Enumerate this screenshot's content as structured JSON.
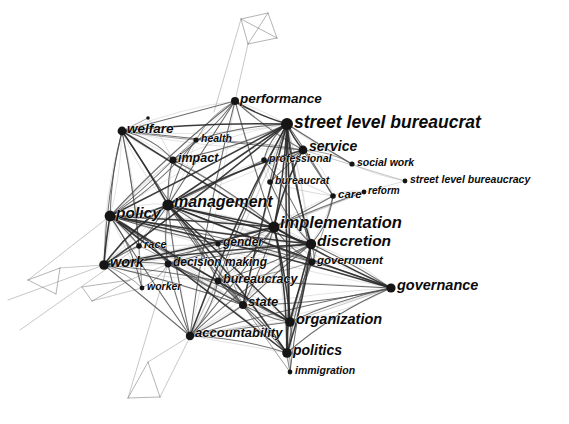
{
  "figure": {
    "type": "network-graph",
    "background_color": "#ffffff",
    "node_color": "#151515",
    "edge_color": "#2a2a2a",
    "label_color": "#0b0b0b",
    "width": 569,
    "height": 424
  },
  "chart_data": {
    "type": "network",
    "title": "",
    "xlabel": "",
    "ylabel": "",
    "grid": false,
    "legend": "none",
    "nodes": [
      {
        "id": "street_level_bureaucrat",
        "label": "street level bureaucrat",
        "x": 287,
        "y": 124,
        "r": 6.0,
        "font": 17.5,
        "anchor": "start",
        "lx": 294,
        "ly": 123
      },
      {
        "id": "implementation",
        "label": "implementation",
        "x": 274,
        "y": 227,
        "r": 5.6,
        "font": 16.5,
        "anchor": "start",
        "lx": 280,
        "ly": 224
      },
      {
        "id": "management",
        "label": "management",
        "x": 168,
        "y": 205,
        "r": 5.6,
        "font": 16.0,
        "anchor": "start",
        "lx": 174,
        "ly": 203
      },
      {
        "id": "discretion",
        "label": "discretion",
        "x": 311,
        "y": 244,
        "r": 5.2,
        "font": 15.5,
        "anchor": "start",
        "lx": 317,
        "ly": 242
      },
      {
        "id": "policy",
        "label": "policy",
        "x": 110,
        "y": 216,
        "r": 5.4,
        "font": 15.5,
        "anchor": "start",
        "lx": 116,
        "ly": 214
      },
      {
        "id": "governance",
        "label": "governance",
        "x": 391,
        "y": 288,
        "r": 4.6,
        "font": 14.5,
        "anchor": "start",
        "lx": 397,
        "ly": 286
      },
      {
        "id": "organization",
        "label": "organization",
        "x": 290,
        "y": 322,
        "r": 4.8,
        "font": 14.5,
        "anchor": "start",
        "lx": 296,
        "ly": 320
      },
      {
        "id": "work",
        "label": "work",
        "x": 104,
        "y": 265,
        "r": 4.8,
        "font": 14.5,
        "anchor": "start",
        "lx": 110,
        "ly": 263
      },
      {
        "id": "politics",
        "label": "politics",
        "x": 287,
        "y": 353,
        "r": 4.8,
        "font": 14.0,
        "anchor": "start",
        "lx": 293,
        "ly": 351
      },
      {
        "id": "service",
        "label": "service",
        "x": 303,
        "y": 150,
        "r": 4.4,
        "font": 14.0,
        "anchor": "start",
        "lx": 309,
        "ly": 147
      },
      {
        "id": "performance",
        "label": "performance",
        "x": 235,
        "y": 101,
        "r": 4.0,
        "font": 13.5,
        "anchor": "start",
        "lx": 240,
        "ly": 99
      },
      {
        "id": "welfare",
        "label": "welfare",
        "x": 122,
        "y": 131,
        "r": 4.4,
        "font": 13.5,
        "anchor": "start",
        "lx": 127,
        "ly": 129
      },
      {
        "id": "accountability",
        "label": "accountability",
        "x": 190,
        "y": 336,
        "r": 4.2,
        "font": 13.0,
        "anchor": "start",
        "lx": 195,
        "ly": 334
      },
      {
        "id": "decision_making",
        "label": "decision making",
        "x": 168,
        "y": 264,
        "r": 3.4,
        "font": 12.0,
        "anchor": "start",
        "lx": 173,
        "ly": 263
      },
      {
        "id": "bureaucracy",
        "label": "bureaucracy",
        "x": 218,
        "y": 281,
        "r": 3.4,
        "font": 12.5,
        "anchor": "start",
        "lx": 223,
        "ly": 280
      },
      {
        "id": "state",
        "label": "state",
        "x": 243,
        "y": 305,
        "r": 4.0,
        "font": 13.0,
        "anchor": "start",
        "lx": 248,
        "ly": 303
      },
      {
        "id": "government",
        "label": "government",
        "x": 312,
        "y": 262,
        "r": 3.4,
        "font": 11.5,
        "anchor": "start",
        "lx": 317,
        "ly": 261
      },
      {
        "id": "impact",
        "label": "impact",
        "x": 173,
        "y": 160,
        "r": 3.6,
        "font": 12.5,
        "anchor": "start",
        "lx": 178,
        "ly": 159
      },
      {
        "id": "health",
        "label": "health",
        "x": 196,
        "y": 140,
        "r": 2.6,
        "font": 10.5,
        "anchor": "start",
        "lx": 201,
        "ly": 139
      },
      {
        "id": "professional",
        "label": "professional",
        "x": 264,
        "y": 160,
        "r": 2.8,
        "font": 10.5,
        "anchor": "start",
        "lx": 269,
        "ly": 159
      },
      {
        "id": "bureaucrat",
        "label": "bureaucrat",
        "x": 270,
        "y": 182,
        "r": 2.8,
        "font": 10.5,
        "anchor": "start",
        "lx": 275,
        "ly": 181
      },
      {
        "id": "social_work",
        "label": "social work",
        "x": 352,
        "y": 164,
        "r": 2.6,
        "font": 10.5,
        "anchor": "start",
        "lx": 357,
        "ly": 163
      },
      {
        "id": "street_level_bureaucracy",
        "label": "street level bureaucracy",
        "x": 405,
        "y": 181,
        "r": 2.4,
        "font": 10.5,
        "anchor": "start",
        "lx": 410,
        "ly": 180
      },
      {
        "id": "care",
        "label": "care",
        "x": 333,
        "y": 196,
        "r": 2.8,
        "font": 11.5,
        "anchor": "start",
        "lx": 338,
        "ly": 195
      },
      {
        "id": "reform",
        "label": "reform",
        "x": 364,
        "y": 192,
        "r": 2.4,
        "font": 10.0,
        "anchor": "start",
        "lx": 368,
        "ly": 191
      },
      {
        "id": "race",
        "label": "race",
        "x": 139,
        "y": 246,
        "r": 2.8,
        "font": 11.0,
        "anchor": "start",
        "lx": 144,
        "ly": 245
      },
      {
        "id": "gender",
        "label": "gender",
        "x": 218,
        "y": 244,
        "r": 2.6,
        "font": 12.0,
        "anchor": "start",
        "lx": 223,
        "ly": 243
      },
      {
        "id": "worker",
        "label": "worker",
        "x": 142,
        "y": 288,
        "r": 2.4,
        "font": 10.5,
        "anchor": "start",
        "lx": 147,
        "ly": 287
      },
      {
        "id": "immigration",
        "label": "immigration",
        "x": 290,
        "y": 372,
        "r": 2.4,
        "font": 10.5,
        "anchor": "start",
        "lx": 295,
        "ly": 371
      },
      {
        "id": "unlabeled_top_welfare",
        "label": "",
        "x": 148,
        "y": 118,
        "r": 1.8,
        "font": 0,
        "anchor": "start",
        "lx": 0,
        "ly": 0
      }
    ],
    "edges": [
      [
        "street_level_bureaucrat",
        "implementation"
      ],
      [
        "street_level_bureaucrat",
        "discretion"
      ],
      [
        "street_level_bureaucrat",
        "service"
      ],
      [
        "street_level_bureaucrat",
        "policy"
      ],
      [
        "street_level_bureaucrat",
        "management"
      ],
      [
        "street_level_bureaucrat",
        "professional"
      ],
      [
        "street_level_bureaucrat",
        "bureaucrat"
      ],
      [
        "street_level_bureaucrat",
        "performance"
      ],
      [
        "street_level_bureaucrat",
        "welfare"
      ],
      [
        "street_level_bureaucrat",
        "care"
      ],
      [
        "street_level_bureaucrat",
        "social_work"
      ],
      [
        "street_level_bureaucrat",
        "government"
      ],
      [
        "street_level_bureaucrat",
        "organization"
      ],
      [
        "street_level_bureaucrat",
        "state"
      ],
      [
        "street_level_bureaucrat",
        "politics"
      ],
      [
        "street_level_bureaucrat",
        "work"
      ],
      [
        "street_level_bureaucrat",
        "bureaucracy"
      ],
      [
        "street_level_bureaucrat",
        "accountability"
      ],
      [
        "street_level_bureaucrat",
        "health"
      ],
      [
        "street_level_bureaucrat",
        "impact"
      ],
      [
        "implementation",
        "discretion"
      ],
      [
        "implementation",
        "management"
      ],
      [
        "implementation",
        "policy"
      ],
      [
        "implementation",
        "governance"
      ],
      [
        "implementation",
        "organization"
      ],
      [
        "implementation",
        "government"
      ],
      [
        "implementation",
        "state"
      ],
      [
        "implementation",
        "politics"
      ],
      [
        "implementation",
        "bureaucracy"
      ],
      [
        "implementation",
        "accountability"
      ],
      [
        "implementation",
        "service"
      ],
      [
        "implementation",
        "work"
      ],
      [
        "implementation",
        "performance"
      ],
      [
        "implementation",
        "reform"
      ],
      [
        "implementation",
        "care"
      ],
      [
        "implementation",
        "gender"
      ],
      [
        "implementation",
        "decision_making"
      ],
      [
        "implementation",
        "welfare"
      ],
      [
        "implementation",
        "impact"
      ],
      [
        "management",
        "policy"
      ],
      [
        "management",
        "discretion"
      ],
      [
        "management",
        "performance"
      ],
      [
        "management",
        "work"
      ],
      [
        "management",
        "welfare"
      ],
      [
        "management",
        "impact"
      ],
      [
        "management",
        "health"
      ],
      [
        "management",
        "accountability"
      ],
      [
        "management",
        "organization"
      ],
      [
        "management",
        "state"
      ],
      [
        "management",
        "governance"
      ],
      [
        "management",
        "race"
      ],
      [
        "management",
        "gender"
      ],
      [
        "management",
        "decision_making"
      ],
      [
        "management",
        "bureaucracy"
      ],
      [
        "management",
        "government"
      ],
      [
        "management",
        "service"
      ],
      [
        "management",
        "professional"
      ],
      [
        "management",
        "politics"
      ],
      [
        "discretion",
        "policy"
      ],
      [
        "discretion",
        "government"
      ],
      [
        "discretion",
        "governance"
      ],
      [
        "discretion",
        "organization"
      ],
      [
        "discretion",
        "bureaucracy"
      ],
      [
        "discretion",
        "decision_making"
      ],
      [
        "discretion",
        "state"
      ],
      [
        "discretion",
        "accountability"
      ],
      [
        "discretion",
        "care"
      ],
      [
        "discretion",
        "professional"
      ],
      [
        "discretion",
        "bureaucrat"
      ],
      [
        "discretion",
        "work"
      ],
      [
        "discretion",
        "politics"
      ],
      [
        "discretion",
        "gender"
      ],
      [
        "discretion",
        "immigration"
      ],
      [
        "policy",
        "work"
      ],
      [
        "policy",
        "race"
      ],
      [
        "policy",
        "welfare"
      ],
      [
        "policy",
        "governance"
      ],
      [
        "policy",
        "organization"
      ],
      [
        "policy",
        "state"
      ],
      [
        "policy",
        "politics"
      ],
      [
        "policy",
        "accountability"
      ],
      [
        "policy",
        "decision_making"
      ],
      [
        "policy",
        "bureaucracy"
      ],
      [
        "policy",
        "gender"
      ],
      [
        "policy",
        "impact"
      ],
      [
        "policy",
        "health"
      ],
      [
        "policy",
        "performance"
      ],
      [
        "policy",
        "worker"
      ],
      [
        "policy",
        "government"
      ],
      [
        "governance",
        "organization"
      ],
      [
        "governance",
        "government"
      ],
      [
        "governance",
        "state"
      ],
      [
        "governance",
        "politics"
      ],
      [
        "governance",
        "accountability"
      ],
      [
        "governance",
        "bureaucracy"
      ],
      [
        "organization",
        "state"
      ],
      [
        "organization",
        "politics"
      ],
      [
        "organization",
        "bureaucracy"
      ],
      [
        "organization",
        "accountability"
      ],
      [
        "organization",
        "government"
      ],
      [
        "organization",
        "immigration"
      ],
      [
        "organization",
        "decision_making"
      ],
      [
        "work",
        "race"
      ],
      [
        "work",
        "worker"
      ],
      [
        "work",
        "welfare"
      ],
      [
        "work",
        "decision_making"
      ],
      [
        "work",
        "state"
      ],
      [
        "work",
        "accountability"
      ],
      [
        "work",
        "gender"
      ],
      [
        "work",
        "bureaucracy"
      ],
      [
        "politics",
        "state"
      ],
      [
        "politics",
        "immigration"
      ],
      [
        "politics",
        "accountability"
      ],
      [
        "politics",
        "bureaucracy"
      ],
      [
        "politics",
        "government"
      ],
      [
        "service",
        "professional"
      ],
      [
        "service",
        "care"
      ],
      [
        "service",
        "bureaucrat"
      ],
      [
        "service",
        "social_work"
      ],
      [
        "service",
        "welfare"
      ],
      [
        "service",
        "performance"
      ],
      [
        "service",
        "health"
      ],
      [
        "performance",
        "health"
      ],
      [
        "performance",
        "impact"
      ],
      [
        "performance",
        "accountability"
      ],
      [
        "performance",
        "welfare"
      ],
      [
        "welfare",
        "impact"
      ],
      [
        "welfare",
        "health"
      ],
      [
        "welfare",
        "race"
      ],
      [
        "welfare",
        "worker"
      ],
      [
        "welfare",
        "state"
      ],
      [
        "accountability",
        "state"
      ],
      [
        "accountability",
        "bureaucracy"
      ],
      [
        "accountability",
        "decision_making"
      ],
      [
        "decision_making",
        "bureaucracy"
      ],
      [
        "decision_making",
        "gender"
      ],
      [
        "decision_making",
        "state"
      ],
      [
        "decision_making",
        "race"
      ],
      [
        "decision_making",
        "worker"
      ],
      [
        "bureaucracy",
        "state"
      ],
      [
        "bureaucracy",
        "gender"
      ],
      [
        "bureaucracy",
        "government"
      ],
      [
        "state",
        "immigration"
      ],
      [
        "government",
        "care"
      ],
      [
        "impact",
        "health"
      ],
      [
        "professional",
        "bureaucrat"
      ],
      [
        "professional",
        "care"
      ],
      [
        "bureaucrat",
        "care"
      ],
      [
        "care",
        "reform"
      ],
      [
        "social_work",
        "street_level_bureaucracy"
      ],
      [
        "reform",
        "street_level_bureaucracy"
      ],
      [
        "race",
        "gender"
      ],
      [
        "race",
        "worker"
      ],
      [
        "gender",
        "state"
      ],
      [
        "welfare",
        "unlabeled_top_welfare"
      ],
      [
        "unlabeled_top_welfare",
        "impact"
      ]
    ],
    "outlier_clusters": [
      {
        "name": "top-quad",
        "points": [
          [
            241,
            19
          ],
          [
            268,
            13
          ],
          [
            277,
            38
          ],
          [
            248,
            44
          ]
        ]
      },
      {
        "name": "left-triangle-upper",
        "points": [
          [
            28,
            280
          ],
          [
            60,
            268
          ],
          [
            56,
            294
          ]
        ]
      },
      {
        "name": "left-triangle-lower",
        "points": [
          [
            82,
            287
          ],
          [
            130,
            280
          ],
          [
            92,
            301
          ]
        ]
      },
      {
        "name": "bottom-triangle",
        "points": [
          [
            148,
            362
          ],
          [
            160,
            397
          ],
          [
            128,
            398
          ]
        ]
      }
    ]
  }
}
